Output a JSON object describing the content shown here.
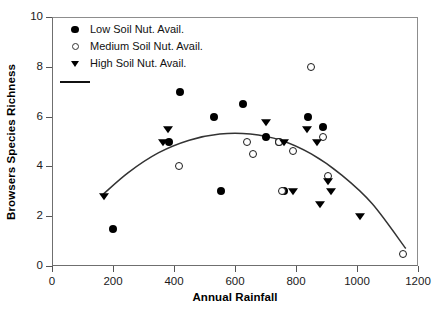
{
  "chart_data": {
    "type": "scatter",
    "title": "",
    "xlabel": "Annual Rainfall",
    "ylabel": "Browsers Species Richness",
    "xlim": [
      0,
      1200
    ],
    "ylim": [
      0,
      10
    ],
    "xticks": [
      0,
      200,
      400,
      600,
      800,
      1000,
      1200
    ],
    "yticks": [
      0,
      2,
      4,
      6,
      8,
      10
    ],
    "grid": false,
    "legend_position": "top-left",
    "series": [
      {
        "name": "Low Soil Nut. Avail.",
        "marker": "filled-circle",
        "color": "#000000",
        "points": [
          [
            200,
            1.5
          ],
          [
            420,
            7.0
          ],
          [
            530,
            6.0
          ],
          [
            555,
            3.0
          ],
          [
            625,
            6.5
          ],
          [
            700,
            5.2
          ],
          [
            745,
            5.0
          ],
          [
            760,
            3.0
          ],
          [
            840,
            6.0
          ],
          [
            890,
            5.6
          ],
          [
            385,
            5.0
          ]
        ]
      },
      {
        "name": "Medium Soil Nut. Avail.",
        "marker": "open-circle",
        "color": "#1a1a1a",
        "points": [
          [
            415,
            4.0
          ],
          [
            640,
            5.0
          ],
          [
            660,
            4.5
          ],
          [
            745,
            5.0
          ],
          [
            755,
            3.0
          ],
          [
            790,
            4.6
          ],
          [
            850,
            8.0
          ],
          [
            890,
            5.2
          ],
          [
            905,
            3.6
          ],
          [
            1150,
            0.5
          ]
        ]
      },
      {
        "name": "High Soil Nut. Avail.",
        "marker": "filled-triangle-down",
        "color": "#000000",
        "points": [
          [
            170,
            2.8
          ],
          [
            365,
            5.0
          ],
          [
            380,
            5.5
          ],
          [
            700,
            5.8
          ],
          [
            760,
            5.0
          ],
          [
            790,
            3.0
          ],
          [
            835,
            5.5
          ],
          [
            870,
            5.0
          ],
          [
            905,
            3.4
          ],
          [
            915,
            3.0
          ],
          [
            880,
            2.5
          ],
          [
            1010,
            2.0
          ]
        ]
      }
    ],
    "fit_curve": {
      "name": "quadratic fit",
      "type": "polynomial",
      "degree": 2,
      "color": "#333333",
      "x_range": [
        165,
        1160
      ],
      "points": [
        [
          165,
          2.85
        ],
        [
          250,
          3.75
        ],
        [
          350,
          4.55
        ],
        [
          450,
          5.05
        ],
        [
          550,
          5.3
        ],
        [
          650,
          5.3
        ],
        [
          750,
          5.05
        ],
        [
          850,
          4.5
        ],
        [
          950,
          3.65
        ],
        [
          1050,
          2.5
        ],
        [
          1160,
          0.7
        ]
      ]
    }
  },
  "legend": {
    "entries": [
      {
        "label": "Low Soil Nut. Avail.",
        "symbol": "filled-circle"
      },
      {
        "label": "Medium Soil Nut. Avail.",
        "symbol": "open-circle"
      },
      {
        "label": "High Soil Nut. Avail.",
        "symbol": "filled-triangle-down"
      },
      {
        "label": "",
        "symbol": "line"
      }
    ]
  }
}
